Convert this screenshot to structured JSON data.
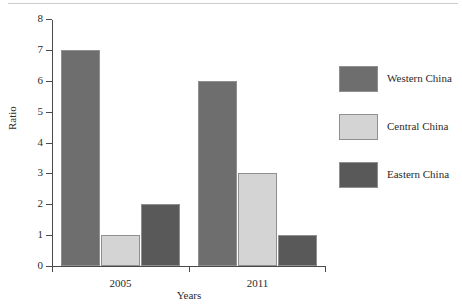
{
  "chart_data": {
    "type": "bar",
    "title": "",
    "xlabel": "Years",
    "ylabel": "Ratio",
    "categories": [
      "2005",
      "2011"
    ],
    "series": [
      {
        "name": "Western China",
        "color": "#6e6e6e",
        "values": [
          7,
          6
        ]
      },
      {
        "name": "Central China",
        "color": "#d4d4d4",
        "values": [
          1,
          3
        ]
      },
      {
        "name": "Eastern China",
        "color": "#595959",
        "values": [
          2,
          1
        ]
      }
    ],
    "ylim": [
      0,
      8
    ],
    "yticks": [
      "0",
      "1",
      "2",
      "3",
      "4",
      "5",
      "6",
      "7",
      "8"
    ],
    "grid": false,
    "legend_position": "right"
  }
}
